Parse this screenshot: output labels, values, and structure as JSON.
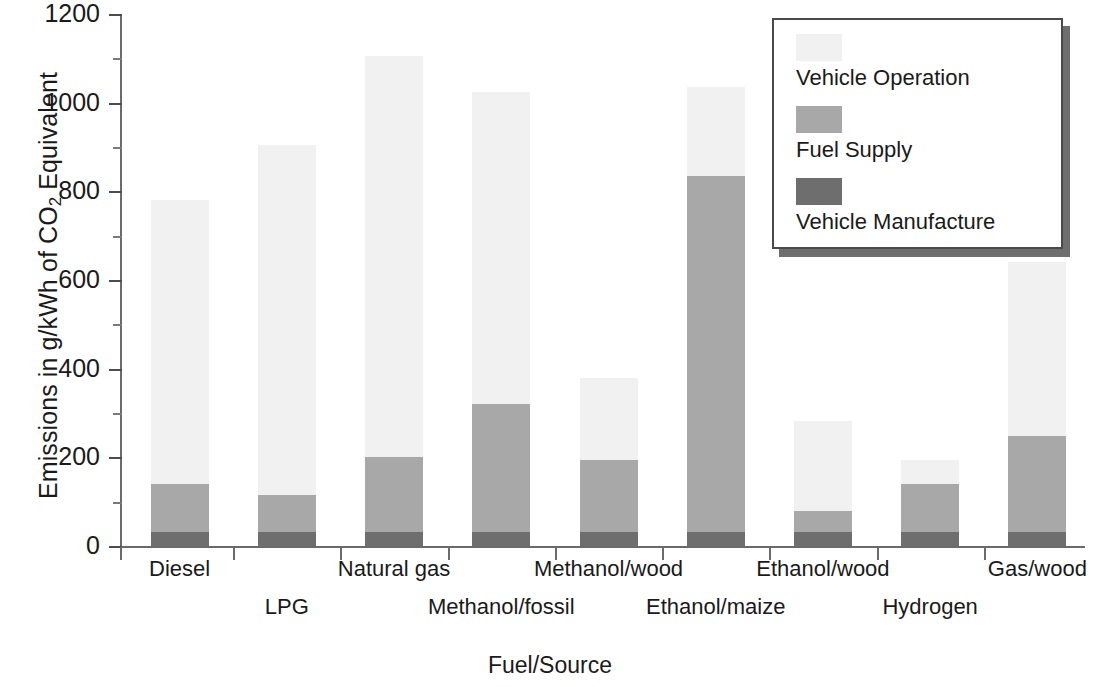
{
  "chart_data": {
    "type": "bar",
    "subtype": "stacked-bar",
    "title": "",
    "xlabel": "Fuel/Source",
    "ylabel": "Emissions in g/kWh of CO2 Equivalent",
    "ylabel_parts": {
      "pre": "Emissions in g/kWh of CO",
      "sub": "2",
      "post": " Equivalent"
    },
    "ylim": [
      0,
      1200
    ],
    "yticks": [
      0,
      200,
      400,
      600,
      800,
      1000,
      1200
    ],
    "ytick_labels": [
      "0",
      "200",
      "400",
      "600",
      "800",
      "1000",
      "1200"
    ],
    "yminor_ticks": [
      100,
      300,
      500,
      700,
      900,
      1100
    ],
    "grid": false,
    "legend_position": "top-right",
    "categories": [
      "Diesel",
      "LPG",
      "Natural gas",
      "Methanol/fossil",
      "Methanol/wood",
      "Ethanol/maize",
      "Ethanol/wood",
      "Hydrogen",
      "Gas/wood"
    ],
    "series": [
      {
        "name": "Vehicle Manufacture",
        "color": "#6e6e6e",
        "values": [
          32,
          32,
          32,
          32,
          32,
          32,
          32,
          32,
          32
        ]
      },
      {
        "name": "Fuel Supply",
        "color": "#a8a8a8",
        "values": [
          108,
          83,
          168,
          288,
          161,
          803,
          48,
          108,
          216
        ]
      },
      {
        "name": "Vehicle Operation",
        "color": "#f1f1f1",
        "values": [
          640,
          790,
          905,
          705,
          187,
          200,
          203,
          55,
          392
        ]
      }
    ],
    "cumulative_tops": {
      "Vehicle Manufacture": [
        32,
        32,
        32,
        32,
        32,
        32,
        32,
        32,
        32
      ],
      "Fuel Supply": [
        140,
        115,
        200,
        320,
        193,
        835,
        80,
        140,
        248
      ],
      "Total": [
        780,
        905,
        1105,
        1025,
        380,
        1035,
        283,
        195,
        640
      ]
    },
    "totals": [
      780,
      905,
      1105,
      1025,
      380,
      1035,
      283,
      195,
      640
    ]
  },
  "legend": {
    "entries": [
      {
        "label": "Vehicle Operation",
        "color": "#f1f1f1"
      },
      {
        "label": "Fuel Supply",
        "color": "#a8a8a8"
      },
      {
        "label": "Vehicle Manufacture",
        "color": "#6e6e6e"
      }
    ]
  },
  "axes": {
    "x_title": "Fuel/Source",
    "y_title": "Emissions in g/kWh of CO2 Equivalent"
  }
}
